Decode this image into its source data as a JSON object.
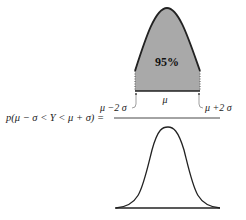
{
  "top_figure": {
    "area_label": "95%",
    "center_label": "μ",
    "left_bound_label": "μ −2 σ",
    "right_bound_label": "μ +2 σ",
    "fill_color": "#a9a9a9",
    "stroke_color": "#222222"
  },
  "formula": {
    "text": "p(μ − σ < Y < μ + σ) ="
  },
  "bottom_figure": {
    "description": "normal bell curve (denominator)"
  }
}
